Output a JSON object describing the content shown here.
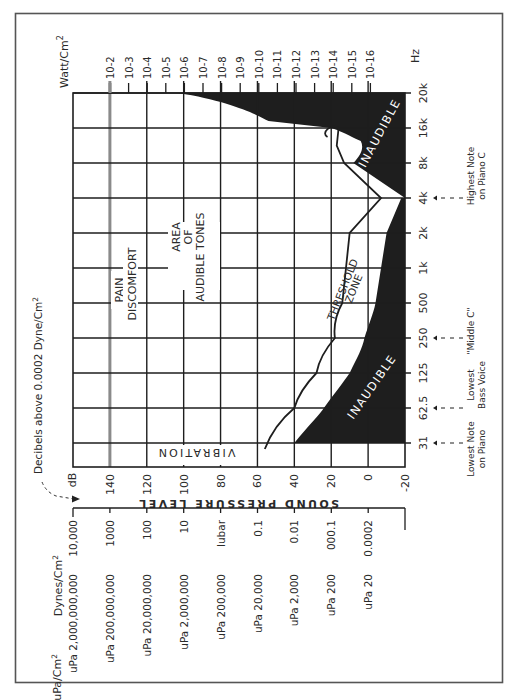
{
  "chart_data": {
    "type": "area",
    "orientation": "rotated 90° counter-clockwise",
    "xlabel": "Hz",
    "ylabel": "SOUND PRESSURE LEVEL",
    "y_unit": "dB",
    "y_caption": "Decibels above 0.0002 Dyne/Cm²",
    "ylim": [
      -20,
      160
    ],
    "grid": true,
    "frequency_ticks": [
      "31",
      "62.5",
      "125",
      "250",
      "500",
      "1k",
      "2k",
      "4k",
      "8k",
      "16k",
      "20k"
    ],
    "db_ticks": [
      "140",
      "120",
      "100",
      "80",
      "60",
      "40",
      "20",
      "0",
      "-20"
    ],
    "watt_ticks": [
      "10-2",
      "10-3",
      "10-4",
      "10-5",
      "10-6",
      "10-7",
      "10-8",
      "10-9",
      "10-10",
      "10-11",
      "10-12",
      "10-13",
      "10-14",
      "10-15",
      "10-16"
    ],
    "watt_header": "Watt/Cm²",
    "dyne_header": "Dynes/Cm²",
    "dyne_ticks": [
      "10,000",
      "1000",
      "100",
      "10",
      "lubar",
      "0.1",
      "0.01",
      "000.1",
      "0.0002"
    ],
    "upa_header": "uPa/Cm²",
    "upa_ticks": [
      "uPa 2,000,000,000",
      "uPa 200,000,000",
      "uPa 20,000,000",
      "uPa 2,000,000",
      "uPa 200,000",
      "uPa 20,000",
      "uPa 2,000",
      "uPa 200",
      "uPa 20"
    ],
    "series": [
      {
        "name": "Upper inaudible boundary (high frequency)",
        "x": [
          "20k",
          "18k",
          "16k",
          "12k",
          "8k",
          "4k"
        ],
        "values": [
          103,
          54,
          20,
          4,
          8,
          -20
        ]
      },
      {
        "name": "Threshold of audibility (lower inaudible boundary)",
        "x": [
          "31",
          "62.5",
          "125",
          "250",
          "500",
          "1k",
          "2k",
          "4k"
        ],
        "values": [
          40,
          24,
          10,
          2,
          -4,
          -7,
          -10,
          -18
        ]
      },
      {
        "name": "Threshold zone upper curve",
        "x": [
          "31",
          "62.5",
          "125",
          "250",
          "500",
          "1k",
          "2k",
          "4k",
          "8k",
          "12k",
          "16k"
        ],
        "values": [
          56,
          40,
          28,
          18,
          14,
          12,
          10,
          -7,
          13,
          17,
          16
        ]
      },
      {
        "name": "Threshold of discomfort / pain",
        "x": [
          "31",
          "20k"
        ],
        "values": [
          140,
          140
        ]
      }
    ],
    "annotations": [
      "PAIN",
      "DISCOMFORT",
      "AREA OF AUDIBLE TONES",
      "THRESHOLD ZONE",
      "INAUDIBLE",
      "INAUDIBLE",
      "VIBRATION"
    ],
    "notes": [
      {
        "label": "Lowest Note on Piano",
        "at": "31"
      },
      {
        "label": "Lowest Bass Voice",
        "at": "62.5"
      },
      {
        "label": "\"Middle C\"",
        "at": "250"
      },
      {
        "label": "Highest Note on Piano C",
        "at": "4k"
      }
    ]
  },
  "labels": {
    "watt_header": "Watt/Cm",
    "watt_sup": "2",
    "hz": "Hz",
    "db": "dB",
    "caption": "Decibels above 0.0002  Dyne/Cm",
    "caption_sup": "2",
    "spl": "SOUND PRESSURE LEVEL",
    "dyne_header": "Dynes/Cm",
    "dyne_sup": "2",
    "upa_header": "uPa/Cm",
    "upa_sup": "2",
    "pain": "PAIN",
    "discomfort": "DISCOMFORT",
    "area1": "AREA",
    "area2": "OF",
    "area3": "AUDIBLE TONES",
    "threshold1": "THRESHOLD",
    "threshold2": "ZONE",
    "inaudible": "INAUDIBLE",
    "vibration": "VIBRATION",
    "note_low_piano_1": "Lowest Note",
    "note_low_piano_2": "on Piano",
    "note_bass_1": "Lowest",
    "note_bass_2": "Bass Voice",
    "note_middle_c": "\"Middle C\"",
    "note_high_1": "Highest Note",
    "note_high_2": "on Piano C"
  },
  "colors": {
    "ink": "#1e1e1e",
    "pain_line": "#8a8a8a",
    "frame": "#555555"
  }
}
